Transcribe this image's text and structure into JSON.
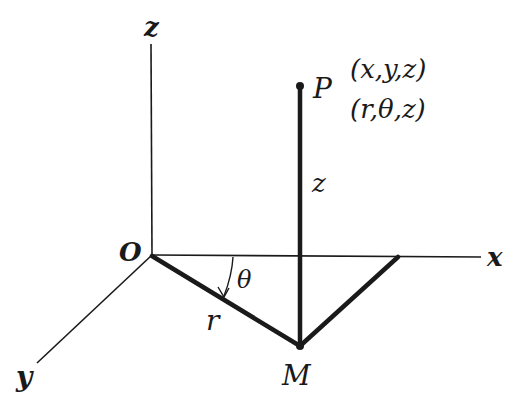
{
  "diagram": {
    "axes": {
      "z_label": "z",
      "x_label": "x",
      "y_label": "y",
      "origin_label": "O"
    },
    "points": {
      "P": {
        "label": "P",
        "cartesian": "(x,y,z)",
        "cylindrical": "(r,θ,z)"
      },
      "M": {
        "label": "M"
      }
    },
    "segments": {
      "height_label": "z",
      "radius_label": "r",
      "angle_label": "θ"
    },
    "colors": {
      "ink": "#1a1a1a",
      "background": "#ffffff"
    }
  }
}
